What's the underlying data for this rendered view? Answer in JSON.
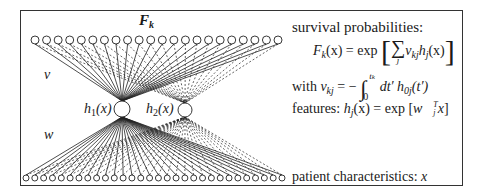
{
  "diagram": {
    "output_label": "F_k",
    "upper_weights_label": "v",
    "lower_weights_label": "w",
    "hidden_nodes": [
      {
        "label": "h1(x)",
        "cx": 122,
        "cy": 109,
        "r": 8
      },
      {
        "label": "h2(x)",
        "cx": 185,
        "cy": 110,
        "r": 7
      }
    ],
    "top_layer": {
      "count": 22,
      "x_start": 35,
      "x_end": 278,
      "y": 40,
      "r": 4
    },
    "bottom_layer": {
      "count": 30,
      "x_start": 26,
      "x_end": 282,
      "y": 178,
      "r": 3
    },
    "edges": {
      "to_h1": "solid",
      "to_h2": "dashed"
    }
  },
  "text": {
    "survival_heading": "survival probabilities:",
    "formula_F": {
      "lhs_F": "F",
      "lhs_sub": "k",
      "lhs_arg": "(x) = exp",
      "sum_symbol": "∑",
      "sum_index": "j",
      "term_v": "v",
      "term_v_sub": "kj",
      "term_h": "h",
      "term_h_sub": "j",
      "term_arg": "(x)"
    },
    "with_line": {
      "with": "with ",
      "v": "v",
      "v_sub": "kj",
      "eq": " = −",
      "integral": "∫",
      "upper": "t",
      "upper_sub": "k",
      "lower": "0",
      "dt": " dt′ h",
      "h_sub": "0j",
      "h_arg": "(t′)"
    },
    "features_line": {
      "label": "features: ",
      "h": "h",
      "h_sub": "j",
      "arg": "(x) = exp [",
      "w": "w⃗",
      "w_sup": "T",
      "w_sub": "j",
      "x": "x",
      "close": "]"
    },
    "patient_line": {
      "label": "patient characteristics: ",
      "var": "x"
    }
  },
  "labels": {
    "h1_text": "h",
    "h1_sub": "1",
    "h1_arg": "(x)",
    "h2_text": "h",
    "h2_sub": "2",
    "h2_arg": "(x)",
    "Fk_F": "F",
    "Fk_sub": "k",
    "nu": "ν",
    "w": "w"
  }
}
